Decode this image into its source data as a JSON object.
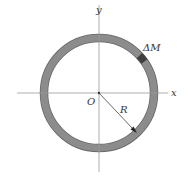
{
  "diagram": {
    "labels": {
      "x_axis": "x",
      "y_axis": "y",
      "origin": "O",
      "radius": "R",
      "mass_element": "ΔM"
    },
    "colors": {
      "ring": "#8c8c8c",
      "ring_outline": "#666666",
      "mass_element": "#3f3f3f",
      "axes": "#999999",
      "arrow": "#333333"
    }
  }
}
